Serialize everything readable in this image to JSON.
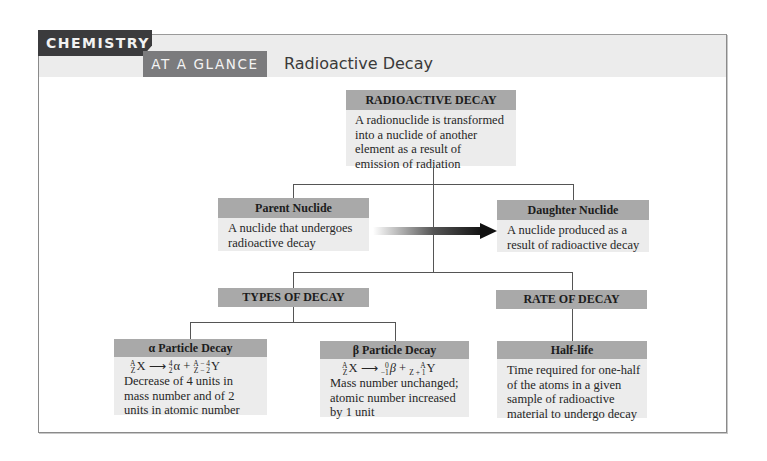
{
  "header": {
    "brand": "CHEMISTRY",
    "subbrand": "AT A GLANCE",
    "title": "Radioactive Decay"
  },
  "diagram": {
    "root": {
      "title": "RADIOACTIVE DECAY",
      "text": "A radionuclide is transformed into a nuclide of another element as a result of emission of radiation"
    },
    "parent": {
      "title": "Parent Nuclide",
      "text": "A nuclide that undergoes radioactive decay"
    },
    "daughter": {
      "title": "Daughter Nuclide",
      "text": "A nuclide produced as a result of radioactive decay"
    },
    "arrow": {
      "from": "Parent Nuclide",
      "to": "Daughter Nuclide",
      "direction": "right"
    },
    "types": {
      "title": "TYPES OF DECAY",
      "alpha": {
        "title": "α Particle Decay",
        "equation": {
          "reactant": {
            "mass": "A",
            "atomic": "Z",
            "symbol": "X"
          },
          "arrow": "⟶",
          "product1": {
            "mass": "4",
            "atomic": "2",
            "symbol": "α"
          },
          "plus": "+",
          "product2": {
            "mass": "A − 4",
            "atomic": "Z − 2",
            "symbol": "Y"
          }
        },
        "text": "Decrease of 4 units in mass number and of 2 units in atomic number"
      },
      "beta": {
        "title": "β Particle Decay",
        "equation": {
          "reactant": {
            "mass": "A",
            "atomic": "Z",
            "symbol": "X"
          },
          "arrow": "⟶",
          "product1": {
            "mass": "0",
            "atomic": "−1",
            "symbol": "β"
          },
          "plus": "+",
          "product2": {
            "mass": "A",
            "atomic": "Z + 1",
            "symbol": "Y"
          }
        },
        "text": "Mass number unchanged; atomic number increased by 1 unit"
      }
    },
    "rate": {
      "title": "RATE OF DECAY",
      "halflife": {
        "title": "Half-life",
        "text": "Time required for one-half of the atoms in a given sample of radioactive material to undergo decay"
      }
    }
  },
  "colors": {
    "dark_tab": "#3b3b3d",
    "glance_tab": "#7b7b7d",
    "header_band": "#ececec",
    "box_header": "#a9a9a9",
    "box_body": "#ececec",
    "connector": "#555555"
  }
}
